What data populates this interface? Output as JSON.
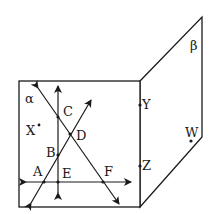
{
  "diagram": {
    "planes": [
      {
        "name": "alpha",
        "label": "α"
      },
      {
        "name": "beta",
        "label": "β"
      }
    ],
    "points": [
      {
        "name": "A",
        "label": "A"
      },
      {
        "name": "B",
        "label": "B"
      },
      {
        "name": "C",
        "label": "C"
      },
      {
        "name": "D",
        "label": "D"
      },
      {
        "name": "E",
        "label": "E"
      },
      {
        "name": "F",
        "label": "F"
      },
      {
        "name": "X",
        "label": "X"
      },
      {
        "name": "Y",
        "label": "Y"
      },
      {
        "name": "Z",
        "label": "Z"
      },
      {
        "name": "W",
        "label": "W"
      }
    ],
    "lines": [
      {
        "name": "vertical-line-CBE",
        "through": [
          "C",
          "B",
          "E"
        ]
      },
      {
        "name": "horizontal-line-AEF",
        "through": [
          "A",
          "E",
          "F"
        ]
      },
      {
        "name": "line-CDF",
        "through": [
          "C",
          "D",
          "F"
        ]
      },
      {
        "name": "line-ABD",
        "through": [
          "A",
          "B",
          "D"
        ]
      }
    ],
    "colors": {
      "ink": "#1a1a1a",
      "background": "#ffffff"
    }
  }
}
